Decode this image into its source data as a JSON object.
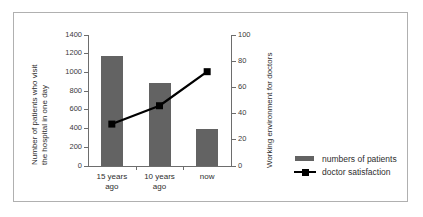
{
  "chart_data": {
    "type": "bar",
    "title": "",
    "categories": [
      "15 years\nago",
      "10 years\nago",
      "now"
    ],
    "category_labels": [
      {
        "line1": "15 years",
        "line2": "ago"
      },
      {
        "line1": "10 years",
        "line2": "ago"
      },
      {
        "line1": "now",
        "line2": ""
      }
    ],
    "series": [
      {
        "name": "numbers of patients",
        "type": "bar",
        "axis": "left",
        "color": "#636363",
        "values": [
          1180,
          890,
          400
        ]
      },
      {
        "name": "doctor satisfaction",
        "type": "line",
        "axis": "right",
        "color": "#000000",
        "marker": "square",
        "values": [
          32,
          46,
          72
        ]
      }
    ],
    "xlabel": "",
    "ylabel": "Number of patients who visit the hospital in one day",
    "ylabel_lines": [
      "Number of patients who visit",
      "the hospital in one day"
    ],
    "y2label": "Working environment for doctors",
    "ylim": [
      0,
      1400
    ],
    "yticks": [
      0,
      200,
      400,
      600,
      800,
      1000,
      1200,
      1400
    ],
    "y2lim": [
      0,
      100
    ],
    "y2ticks": [
      0,
      20,
      40,
      60,
      80,
      100
    ],
    "grid": false,
    "legend_position": "bottom-right"
  },
  "legend": {
    "items": [
      {
        "label": "numbers of patients",
        "key": "bar-swatch"
      },
      {
        "label": "doctor satisfaction",
        "key": "line-marker-swatch"
      }
    ]
  }
}
